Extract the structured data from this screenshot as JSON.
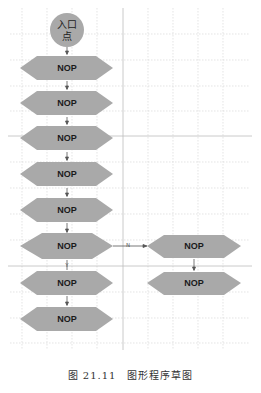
{
  "diagram": {
    "entry_node": {
      "label_line1": "入口",
      "label_line2": "点"
    },
    "left_column_nodes": [
      {
        "label": "NOP",
        "shape": "hexagon"
      },
      {
        "label": "NOP",
        "shape": "hexagon"
      },
      {
        "label": "NOP",
        "shape": "hexagon"
      },
      {
        "label": "NOP",
        "shape": "hexagon"
      },
      {
        "label": "NOP",
        "shape": "hexagon"
      },
      {
        "label": "NOP",
        "shape": "diamond"
      },
      {
        "label": "NOP",
        "shape": "hexagon"
      },
      {
        "label": "NOP",
        "shape": "hexagon"
      }
    ],
    "right_column_nodes": [
      {
        "label": "NOP",
        "shape": "hexagon"
      },
      {
        "label": "NOP",
        "shape": "hexagon"
      }
    ],
    "edge_labels": {
      "no_branch": "N",
      "yes_branch": "Y"
    },
    "colors": {
      "node_fill": "#a9a9a9",
      "grid_dotted": "#d9d9d9",
      "grid_solid": "#bdbdbd",
      "arrow": "#555555"
    }
  },
  "caption": "图 21.11　图形程序草图"
}
